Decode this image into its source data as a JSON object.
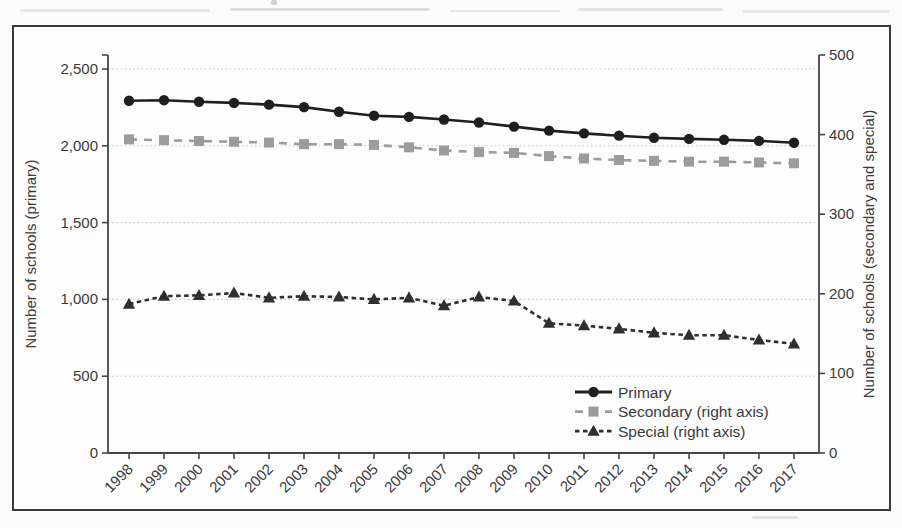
{
  "figure": {
    "background": "#fcfcfc",
    "frame_border_color": "#3a3a3a",
    "grid_color": "#cbcbcb",
    "text_color": "#3b3b3b"
  },
  "chart_data": {
    "type": "line",
    "title": "",
    "x_label": "",
    "x": [
      "1998",
      "1999",
      "2000",
      "2001",
      "2002",
      "2003",
      "2004",
      "2005",
      "2006",
      "2007",
      "2008",
      "2009",
      "2010",
      "2011",
      "2012",
      "2013",
      "2014",
      "2015",
      "2016",
      "2017"
    ],
    "left_axis": {
      "label": "Number of schools (primary)",
      "range": [
        0,
        2500
      ],
      "tick_values": [
        0,
        500,
        1000,
        1500,
        2000,
        2500
      ],
      "tick_labels": [
        "0",
        "500",
        "1,000",
        "1,500",
        "2,000",
        "2,500"
      ]
    },
    "right_axis": {
      "label": "Number of schools (secondary and special)",
      "range": [
        0,
        500
      ],
      "tick_values": [
        0,
        100,
        200,
        300,
        400,
        500
      ],
      "tick_labels": [
        "0",
        "100",
        "200",
        "300",
        "400",
        "500"
      ]
    },
    "grid": "horizontal-dotted",
    "legend_position": "lower-right-inside",
    "series": [
      {
        "name": "Primary",
        "axis": "left",
        "color": "#1f1f1f",
        "marker": "circle",
        "line_style": "solid",
        "values": [
          2293,
          2297,
          2287,
          2279,
          2268,
          2252,
          2222,
          2196,
          2188,
          2171,
          2152,
          2125,
          2099,
          2081,
          2066,
          2052,
          2045,
          2039,
          2032,
          2020
        ]
      },
      {
        "name": "Secondary (right axis)",
        "axis": "right",
        "color": "#9c9c9c",
        "marker": "square",
        "line_style": "dashed",
        "values": [
          394,
          393,
          392,
          391,
          390,
          388,
          388,
          387,
          384,
          380,
          378,
          377,
          373,
          370,
          368,
          367,
          366,
          366,
          365,
          364
        ]
      },
      {
        "name": "Special (right axis)",
        "axis": "right",
        "color": "#2f2f2f",
        "marker": "triangle",
        "line_style": "dashed",
        "values": [
          187,
          197,
          198,
          201,
          195,
          197,
          196,
          193,
          195,
          185,
          196,
          191,
          163,
          160,
          156,
          151,
          148,
          148,
          142,
          137
        ]
      }
    ]
  }
}
